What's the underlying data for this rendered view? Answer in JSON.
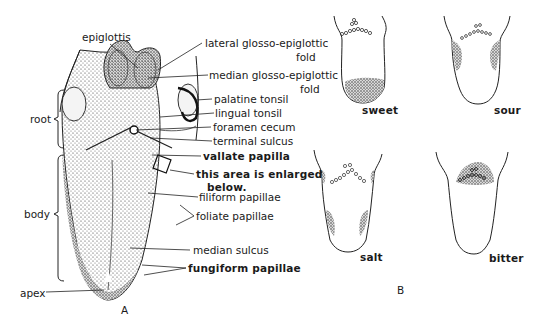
{
  "figure_a": {
    "panel_label": "A",
    "regions": {
      "root": "root",
      "body": "body",
      "apex": "apex"
    },
    "labels": {
      "epiglottis": "epiglottis",
      "lateral_fold_1": "lateral glosso-epiglottic",
      "lateral_fold_2": "fold",
      "median_fold_1": "median glosso-epiglottic",
      "median_fold_2": "fold",
      "palatine_tonsil": "palatine tonsil",
      "lingual_tonsil": "lingual tonsil",
      "foramen_cecum": "foramen cecum",
      "terminal_sulcus": "terminal sulcus",
      "vallate_papilla": "vallate papilla",
      "enlarged_1": "this area is enlarged",
      "enlarged_2": "below.",
      "filiform_papillae": "filiform papillae",
      "foliate_papillae": "foliate papillae",
      "median_sulcus": "median sulcus",
      "fungiform_papillae": "fungiform papillae"
    }
  },
  "figure_b": {
    "panel_label": "B",
    "tastes": [
      {
        "label": "sweet"
      },
      {
        "label": "sour"
      },
      {
        "label": "salt"
      },
      {
        "label": "bitter"
      }
    ]
  }
}
